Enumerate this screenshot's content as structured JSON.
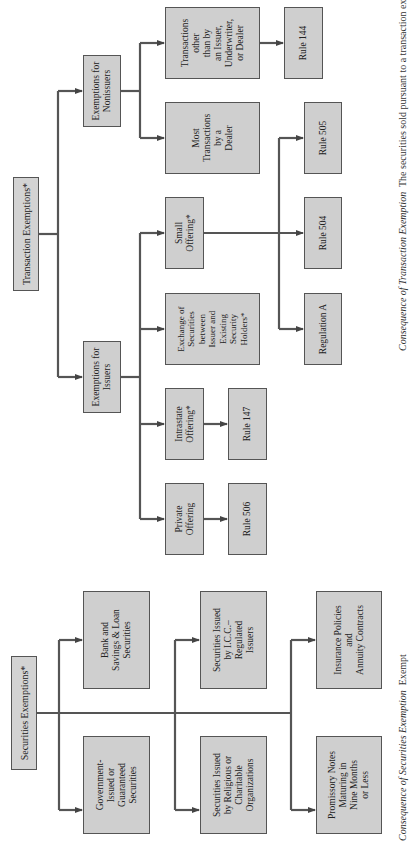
{
  "colors": {
    "box_fill": "#cfcfcf",
    "box_border": "#555555",
    "connector": "#555555",
    "background": "#ffffff"
  },
  "securities_exemptions": {
    "root": "Securities Exemptions*",
    "children": [
      "Government-\nIssued or\nGuaranteed\nSecurities",
      "Bank and\nSavings & Loan\nSecurities",
      "Securities Issued\nby Religious or\nCharitable\nOrganizations",
      "Securities Issued\nby I.C.C.–\nRegulated\nIssuers",
      "Promissory Notes\nMaturing in\nNine Months\nor Less",
      "Insurance Policies\nand\nAnnuity Contracts"
    ],
    "caption_italic": "Consequence of Securities Exemption",
    "caption_text": "Exempt"
  },
  "transaction_exemptions": {
    "root": "Transaction Exemptions*",
    "issuers": {
      "label": "Exemptions for\nIssuers",
      "private_offering": "Private\nOffering",
      "rule_506": "Rule 506",
      "intrastate_offering": "Intrastate\nOffering*",
      "rule_147": "Rule 147",
      "exchange": "Exchange of\nSecurities\nbetween\nIssuer and\nExisting\nSecurity\nHolders*",
      "small_offering": "Small\nOffering*",
      "regulation_a": "Regulation A",
      "rule_504": "Rule 504",
      "rule_505": "Rule 505"
    },
    "nonissuers": {
      "label": "Exemptions for\nNonissuers",
      "dealer": "Most\nTransactions\nby a\nDealer",
      "other": "Transactions\nother\nthan by\nan Issuer,\nUnderwriter,\nor Dealer",
      "rule_144": "Rule 144"
    },
    "caption_italic": "Consequence of Transaction Exemption",
    "caption_text": "The securities sold pursuant to a transaction exemption"
  }
}
